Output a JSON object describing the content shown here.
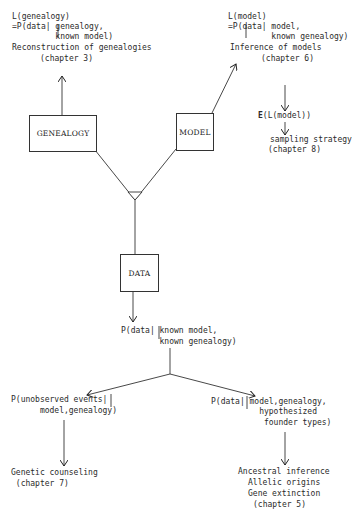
{
  "nodes": {
    "genealogy": {
      "label": "GENEALOGY"
    },
    "model": {
      "label": "MODEL"
    },
    "data": {
      "label": "DATA"
    }
  },
  "genealogy_branch": {
    "line1": "L(genealogy)",
    "line2": "=P(data| genealogy,",
    "line3": "         known model)",
    "title": "Reconstruction of genealogies",
    "chapter": "(chapter 3)"
  },
  "model_branch": {
    "line1": "L(model)",
    "line2": "=P(data| model,",
    "line3": "         known genealogy)",
    "title": "Inference of models",
    "chapter": "(chapter 6)",
    "expectation": "E(L(model))",
    "expectation_symbol": "E",
    "expectation_rest": "(L(model))",
    "sampling_title": "sampling strategy",
    "sampling_chapter": "(chapter 8)"
  },
  "data_likelihood": {
    "line1": "P(data| known model,",
    "line2": "        known genealogy)"
  },
  "left_branch": {
    "line1": "P(unobserved events|",
    "line2": "      model,genealogy)",
    "title": "Genetic counseling",
    "chapter": " (chapter 7)"
  },
  "right_branch": {
    "line1": "P(data| model,genealogy,",
    "line2": "          hypothesized",
    "line3": "           founder types)",
    "out1": "Ancestral inference",
    "out2": "Allelic origins",
    "out3": "Gene extinction",
    "chapter": "(chapter 5)"
  },
  "colors": {
    "ink": "#2a2a2a",
    "background": "#ffffff"
  }
}
